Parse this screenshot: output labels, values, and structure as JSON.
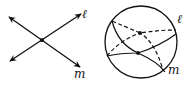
{
  "figure": {
    "left_panel": {
      "description": "Two intersecting lines in a plane",
      "lines": [
        {
          "label": "ℓ",
          "from": [
            10,
            61
          ],
          "to": [
            81,
            14
          ]
        },
        {
          "label": "m",
          "from": [
            9,
            17
          ],
          "to": [
            80,
            67
          ]
        }
      ],
      "intersection": [
        42,
        40
      ]
    },
    "right_panel": {
      "description": "Two great circles on a sphere intersecting at two points",
      "sphere": {
        "cx": 141,
        "cy": 42,
        "r": 36
      },
      "great_circles": [
        {
          "label": "ℓ"
        },
        {
          "label": "m"
        }
      ],
      "intersections": [
        [
          140,
          33
        ],
        [
          138,
          53
        ]
      ]
    },
    "labels": {
      "l_left": "ℓ",
      "m_left": "m",
      "l_right": "ℓ",
      "m_right": "m"
    },
    "colors": {
      "stroke": "#111111",
      "background": "#ffffff"
    }
  }
}
